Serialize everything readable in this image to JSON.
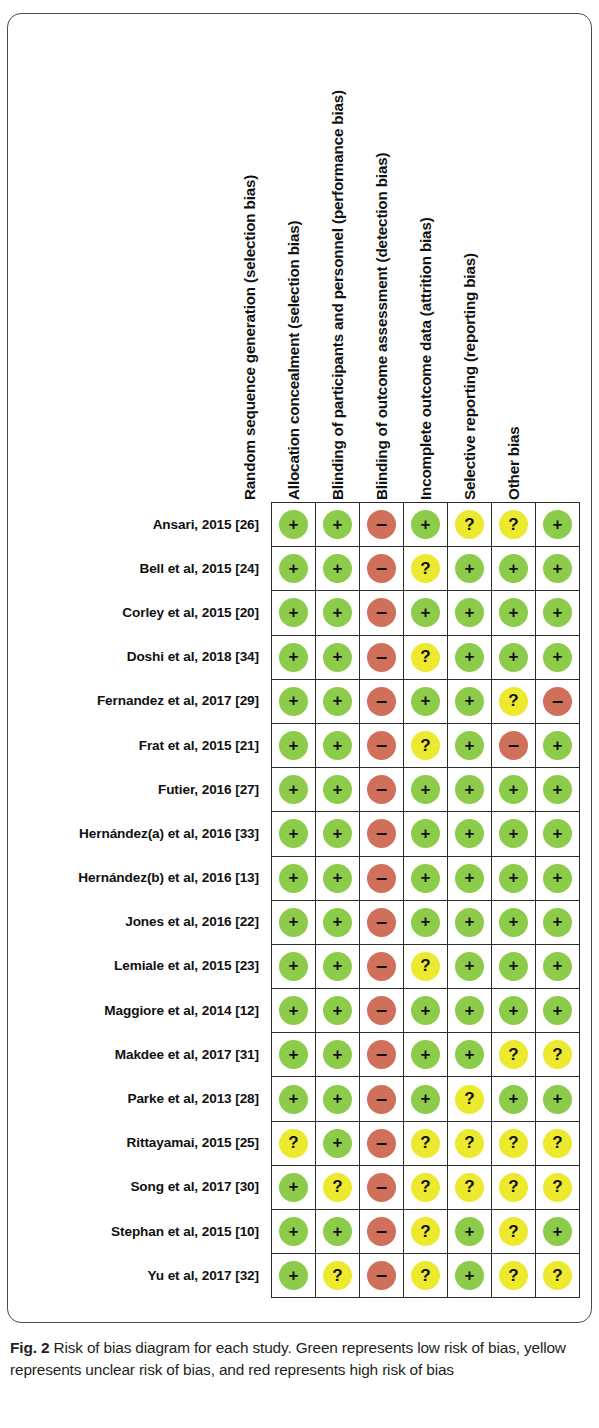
{
  "figure": {
    "label": "Fig. 2",
    "caption": "Risk of bias diagram for each study. Green represents low risk of bias, yellow represents unclear risk of bias, and red represents high risk of bias"
  },
  "columns": [
    "Random sequence generation (selection bias)",
    "Allocation concealment (selection bias)",
    "Blinding of participants and personnel (performance bias)",
    "Blinding of outcome assessment (detection bias)",
    "Incomplete outcome data (attrition bias)",
    "Selective reporting (reporting bias)",
    "Other bias"
  ],
  "legend": {
    "low": {
      "glyph": "+",
      "color": "#8dcc4a",
      "meaning": "low risk of bias"
    },
    "unclear": {
      "glyph": "?",
      "color": "#ece92f",
      "meaning": "unclear risk of bias"
    },
    "high": {
      "glyph": "–",
      "color": "#d0705a",
      "meaning": "high risk of bias"
    }
  },
  "chart_data": {
    "type": "heatmap",
    "title": "Risk of bias diagram for each study",
    "xlabel": "",
    "ylabel": "",
    "grid": true,
    "legend_position": "caption",
    "categories": [
      "Random sequence generation (selection bias)",
      "Allocation concealment (selection bias)",
      "Blinding of participants and personnel (performance bias)",
      "Blinding of outcome assessment (detection bias)",
      "Incomplete outcome data (attrition bias)",
      "Selective reporting (reporting bias)",
      "Other bias"
    ],
    "value_map": {
      "low": "+",
      "unclear": "?",
      "high": "–"
    },
    "rows": [
      {
        "study": "Ansari, 2015  [26]",
        "values": [
          "low",
          "low",
          "high",
          "low",
          "unclear",
          "unclear",
          "low"
        ]
      },
      {
        "study": "Bell et al, 2015 [24]",
        "values": [
          "low",
          "low",
          "high",
          "unclear",
          "low",
          "low",
          "low"
        ]
      },
      {
        "study": "Corley et al, 2015 [20]",
        "values": [
          "low",
          "low",
          "high",
          "low",
          "low",
          "low",
          "low"
        ]
      },
      {
        "study": "Doshi et al, 2018 [34]",
        "values": [
          "low",
          "low",
          "high",
          "unclear",
          "low",
          "low",
          "low"
        ]
      },
      {
        "study": "Fernandez et al, 2017 [29]",
        "values": [
          "low",
          "low",
          "high",
          "low",
          "low",
          "unclear",
          "high"
        ]
      },
      {
        "study": "Frat et al, 2015 [21]",
        "values": [
          "low",
          "low",
          "high",
          "unclear",
          "low",
          "high",
          "low"
        ]
      },
      {
        "study": "Futier, 2016  [27]",
        "values": [
          "low",
          "low",
          "high",
          "low",
          "low",
          "low",
          "low"
        ]
      },
      {
        "study": "Hernández(a) et al, 2016 [33]",
        "values": [
          "low",
          "low",
          "high",
          "low",
          "low",
          "low",
          "low"
        ]
      },
      {
        "study": "Hernández(b)  et al, 2016 [13]",
        "values": [
          "low",
          "low",
          "high",
          "low",
          "low",
          "low",
          "low"
        ]
      },
      {
        "study": "Jones et al, 2016 [22]",
        "values": [
          "low",
          "low",
          "high",
          "low",
          "low",
          "low",
          "low"
        ]
      },
      {
        "study": "Lemiale et al, 2015 [23]",
        "values": [
          "low",
          "low",
          "high",
          "unclear",
          "low",
          "low",
          "low"
        ]
      },
      {
        "study": "Maggiore et al, 2014 [12]",
        "values": [
          "low",
          "low",
          "high",
          "low",
          "low",
          "low",
          "low"
        ]
      },
      {
        "study": "Makdee et al, 2017 [31]",
        "values": [
          "low",
          "low",
          "high",
          "low",
          "low",
          "unclear",
          "unclear"
        ]
      },
      {
        "study": "Parke et al, 2013 [28]",
        "values": [
          "low",
          "low",
          "high",
          "low",
          "unclear",
          "low",
          "low"
        ]
      },
      {
        "study": "Rittayamai, 2015  [25]",
        "values": [
          "unclear",
          "low",
          "high",
          "unclear",
          "unclear",
          "unclear",
          "unclear"
        ]
      },
      {
        "study": "Song et al, 2017 [30]",
        "values": [
          "low",
          "unclear",
          "high",
          "unclear",
          "unclear",
          "unclear",
          "unclear"
        ]
      },
      {
        "study": "Stephan et al, 2015 [10]",
        "values": [
          "low",
          "low",
          "high",
          "unclear",
          "low",
          "unclear",
          "low"
        ]
      },
      {
        "study": "Yu et al, 2017 [32]",
        "values": [
          "low",
          "unclear",
          "high",
          "unclear",
          "low",
          "unclear",
          "unclear"
        ]
      }
    ]
  }
}
